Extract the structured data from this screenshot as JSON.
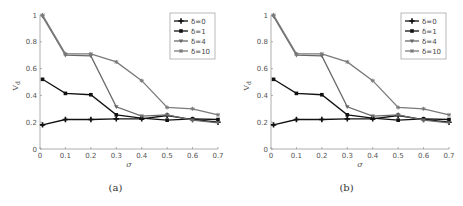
{
  "figure": {
    "panels": [
      {
        "id": "a",
        "caption": "(a)"
      },
      {
        "id": "b",
        "caption": "(b)"
      }
    ]
  },
  "chart_data": [
    {
      "type": "line",
      "title": "",
      "caption": "(a)",
      "xlabel": "σ",
      "ylabel": "V_d",
      "xlim": [
        0,
        0.7
      ],
      "ylim": [
        0,
        1
      ],
      "xticks": [
        "0",
        "0.1",
        "0.2",
        "0.3",
        "0.4",
        "0.5",
        "0.6",
        "0.7"
      ],
      "yticks": [
        "0",
        "0.2",
        "0.4",
        "0.6",
        "0.8",
        "1"
      ],
      "grid": false,
      "legend_position": "upper right",
      "x": [
        0.01,
        0.1,
        0.2,
        0.3,
        0.4,
        0.5,
        0.6,
        0.7
      ],
      "series": [
        {
          "name": "δ=0",
          "color": "#111111",
          "marker": "plus",
          "values": [
            0.18,
            0.22,
            0.22,
            0.225,
            0.225,
            0.25,
            0.22,
            0.2
          ]
        },
        {
          "name": "δ=1",
          "color": "#111111",
          "marker": "square",
          "values": [
            0.52,
            0.415,
            0.405,
            0.255,
            0.23,
            0.215,
            0.225,
            0.22
          ]
        },
        {
          "name": "δ=4",
          "color": "#6a6a6a",
          "marker": "triangle-down",
          "values": [
            0.99,
            0.7,
            0.695,
            0.315,
            0.245,
            0.255,
            0.215,
            0.195
          ]
        },
        {
          "name": "δ=10",
          "color": "#7a7a7a",
          "marker": "star",
          "values": [
            1.0,
            0.71,
            0.71,
            0.65,
            0.51,
            0.31,
            0.3,
            0.255
          ]
        }
      ]
    },
    {
      "type": "line",
      "title": "",
      "caption": "(b)",
      "xlabel": "σ",
      "ylabel": "V_d",
      "xlim": [
        0,
        0.7
      ],
      "ylim": [
        0,
        1
      ],
      "xticks": [
        "0",
        "0.1",
        "0.2",
        "0.3",
        "0.4",
        "0.5",
        "0.6",
        "0.7"
      ],
      "yticks": [
        "0",
        "0.2",
        "0.4",
        "0.6",
        "0.8",
        "1"
      ],
      "grid": false,
      "legend_position": "upper right",
      "x": [
        0.01,
        0.1,
        0.2,
        0.3,
        0.4,
        0.5,
        0.6,
        0.7
      ],
      "series": [
        {
          "name": "δ=0",
          "color": "#111111",
          "marker": "plus",
          "values": [
            0.18,
            0.22,
            0.22,
            0.225,
            0.225,
            0.25,
            0.22,
            0.2
          ]
        },
        {
          "name": "δ=1",
          "color": "#111111",
          "marker": "square",
          "values": [
            0.52,
            0.415,
            0.405,
            0.255,
            0.23,
            0.215,
            0.225,
            0.22
          ]
        },
        {
          "name": "δ=4",
          "color": "#6a6a6a",
          "marker": "triangle-down",
          "values": [
            0.99,
            0.7,
            0.695,
            0.315,
            0.245,
            0.255,
            0.215,
            0.195
          ]
        },
        {
          "name": "δ=10",
          "color": "#7a7a7a",
          "marker": "star",
          "values": [
            1.0,
            0.71,
            0.71,
            0.65,
            0.51,
            0.31,
            0.3,
            0.255
          ]
        }
      ]
    }
  ]
}
